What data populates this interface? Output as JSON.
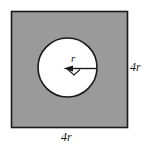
{
  "figure": {
    "type": "geometry-diagram",
    "square": {
      "side_label": "4r",
      "fill_color": "#9a9a9a",
      "stroke_color": "#1a1a1a",
      "x": 11,
      "y": 11,
      "width": 117,
      "height": 117
    },
    "circle": {
      "fill_color": "#ffffff",
      "stroke_color": "#1a1a1a",
      "center_x": 67.5,
      "center_y": 67.5,
      "radius": 29.5
    },
    "radius_arrow": {
      "label": "r",
      "stroke_color": "#1a1a1a",
      "from_x": 67.5,
      "from_y": 68.5,
      "to_x": 97,
      "to_y": 68.5
    },
    "labels": {
      "right_side": "4r",
      "bottom_side": "4r",
      "radius": "r"
    }
  }
}
